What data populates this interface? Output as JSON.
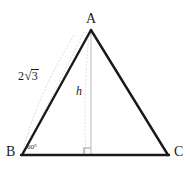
{
  "figure": {
    "background_color": "#ffffff",
    "stroke_color": "#1a1a1a",
    "guide_color": "#cfcfcf",
    "altitude_color": "#c8c8c8",
    "vertices": {
      "a": {
        "label": "A",
        "x": 91,
        "y": 30
      },
      "b": {
        "label": "B",
        "x": 22,
        "y": 155
      },
      "c": {
        "label": "C",
        "x": 168,
        "y": 155
      }
    },
    "angle": {
      "at_vertex": "B",
      "value": "60",
      "degree_symbol": "°",
      "label": "60°"
    },
    "side_ab": {
      "label": "2√3",
      "coefficient": "2",
      "radical_sign": "√",
      "radicand": "3"
    },
    "altitude": {
      "label": "h",
      "from": "A",
      "foot_x": 91,
      "foot_y": 155
    },
    "right_angle": {
      "label": "right-angle-marker",
      "size": 7
    }
  }
}
